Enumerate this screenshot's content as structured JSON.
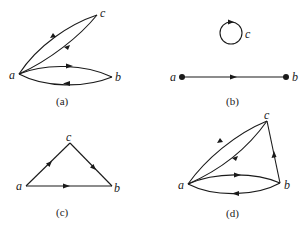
{
  "figure": {
    "panels": [
      {
        "id": "a",
        "caption": "(a)",
        "vertices": [
          {
            "name": "a",
            "label": "a"
          },
          {
            "name": "b",
            "label": "b"
          },
          {
            "name": "c",
            "label": "c"
          }
        ],
        "edges": [
          {
            "from": "a",
            "to": "c",
            "style": "outer curve"
          },
          {
            "from": "c",
            "to": "a",
            "style": "inner curve"
          },
          {
            "from": "a",
            "to": "b",
            "style": "upper curve"
          },
          {
            "from": "b",
            "to": "a",
            "style": "lower curve"
          }
        ]
      },
      {
        "id": "b",
        "caption": "(b)",
        "vertices": [
          {
            "name": "a",
            "label": "a",
            "dot": true
          },
          {
            "name": "b",
            "label": "b",
            "dot": true
          },
          {
            "name": "c",
            "label": "c"
          }
        ],
        "edges": [
          {
            "from": "c",
            "to": "c",
            "style": "loop"
          },
          {
            "from": "a",
            "to": "b",
            "style": "straight"
          }
        ]
      },
      {
        "id": "c",
        "caption": "(c)",
        "vertices": [
          {
            "name": "a",
            "label": "a"
          },
          {
            "name": "b",
            "label": "b"
          },
          {
            "name": "c",
            "label": "c"
          }
        ],
        "edges": [
          {
            "from": "a",
            "to": "c",
            "style": "straight"
          },
          {
            "from": "c",
            "to": "b",
            "style": "straight"
          },
          {
            "from": "a",
            "to": "b",
            "style": "straight"
          }
        ]
      },
      {
        "id": "d",
        "caption": "(d)",
        "vertices": [
          {
            "name": "a",
            "label": "a"
          },
          {
            "name": "b",
            "label": "b"
          },
          {
            "name": "c",
            "label": "c"
          }
        ],
        "edges": [
          {
            "from": "a",
            "to": "c",
            "style": "outer curve"
          },
          {
            "from": "c",
            "to": "a",
            "style": "inner curve"
          },
          {
            "from": "b",
            "to": "c",
            "style": "straight"
          },
          {
            "from": "a",
            "to": "b",
            "style": "upper curve"
          },
          {
            "from": "b",
            "to": "a",
            "style": "lower curve"
          }
        ]
      }
    ]
  },
  "colors": {
    "ink": "#1a1a1a",
    "background": "#ffffff"
  }
}
